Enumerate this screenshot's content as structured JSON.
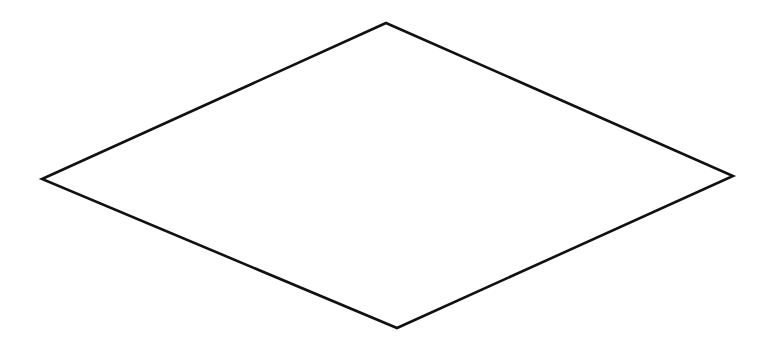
{
  "diagram": {
    "background": "#ffffff",
    "shapes": [
      {
        "type": "rhombus",
        "name": "decision-diamond",
        "stroke": "#111111",
        "stroke_width": 2.6,
        "fill": "#ffffff",
        "label": "",
        "vertices": {
          "top": [
            386,
            23
          ],
          "right": [
            733,
            176
          ],
          "bottom": [
            397,
            328
          ],
          "left": [
            42,
            179
          ]
        }
      }
    ]
  }
}
